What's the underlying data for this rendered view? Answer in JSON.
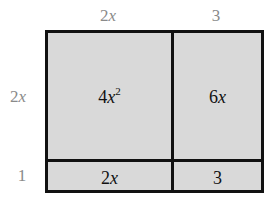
{
  "top_labels": {
    "left": "2x",
    "right": "3"
  },
  "side_labels": {
    "top": "2x",
    "bottom": "1"
  },
  "cells": {
    "top_left": {
      "coef": "4",
      "var": "x",
      "exp": "2"
    },
    "top_right": {
      "coef": "6",
      "var": "x"
    },
    "bottom_left": {
      "coef": "2",
      "var": "x"
    },
    "bottom_right": {
      "value": "3"
    }
  },
  "colors": {
    "fill": "#d9d9d9",
    "border": "#111111",
    "label": "#8a8a8a"
  }
}
